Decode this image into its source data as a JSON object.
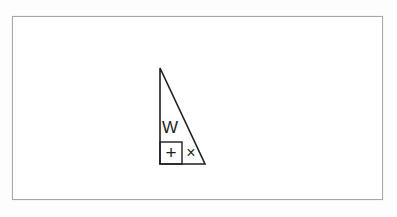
{
  "page": {
    "background_color": "#fdfdfd",
    "paper_color": "#ffffff",
    "border_color": "#a8a8a8",
    "ink_color": "#1f1f22"
  },
  "figure": {
    "name": "right-triangle-with-symbols",
    "triangle": {
      "apex": {
        "x": 160,
        "y": 68
      },
      "bottom_left": {
        "x": 160,
        "y": 164
      },
      "bottom_right": {
        "x": 205,
        "y": 164
      },
      "stroke_width": 1.6
    },
    "inner_box": {
      "name": "plus-box",
      "x": 160,
      "y": 142,
      "width": 22,
      "height": 22,
      "stroke_width": 1.4
    },
    "symbols": [
      {
        "name": "letter-w",
        "glyph": "W",
        "x": 170,
        "y": 126,
        "font_size": 17
      },
      {
        "name": "plus-sign",
        "glyph": "+",
        "x": 171,
        "y": 153,
        "font_size": 18
      },
      {
        "name": "times-sign",
        "glyph": "×",
        "x": 191,
        "y": 153,
        "font_size": 16
      }
    ]
  },
  "labels": {
    "figure_caption": "",
    "alt_text": "Right triangle containing the letter W above a boxed plus sign, with a multiplication cross beside the box"
  }
}
